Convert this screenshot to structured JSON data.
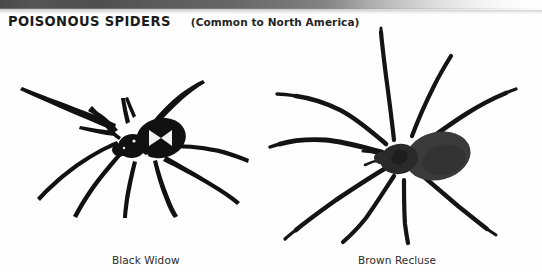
{
  "page": {
    "width": 542,
    "height": 272,
    "background_color": "#ffffff",
    "ink_color": "#111111"
  },
  "header": {
    "title": "POISONOUS SPIDERS",
    "subtitle": "(Common to North America)"
  },
  "figures": [
    {
      "id": "black-widow",
      "caption": "Black Widow",
      "marking": "hourglass",
      "leg_count": 8,
      "body_color": "#111111"
    },
    {
      "id": "brown-recluse",
      "caption": "Brown Recluse",
      "marking": "violin",
      "leg_count": 8,
      "body_color": "#3a3a3a"
    }
  ]
}
